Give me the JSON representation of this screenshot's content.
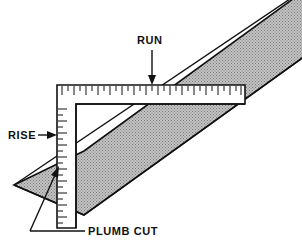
{
  "diagram": {
    "background_color": "#ffffff",
    "line_color": "#111111",
    "board_fill_color": "#b8b8b8",
    "board_hatch_color": "#6f6f6f",
    "labels": {
      "run": "RUN",
      "rise": "RISE",
      "plumb_cut": "PLUMB CUT"
    },
    "annotations": [
      {
        "name": "run",
        "text": "RUN",
        "text_x": 137,
        "text_y": 44,
        "arrow_direction": "down",
        "arrow_from_x": 152,
        "arrow_from_y": 50,
        "arrow_to_x": 152,
        "arrow_to_y": 84,
        "points_at": "horizontal-arm-top-edge"
      },
      {
        "name": "rise",
        "text": "RISE",
        "text_x": 8,
        "text_y": 139,
        "arrow_direction": "right",
        "arrow_from_x": 38,
        "arrow_from_y": 135,
        "arrow_to_x": 57,
        "arrow_to_y": 135,
        "points_at": "vertical-arm-left-edge"
      },
      {
        "name": "plumb-cut",
        "text": "PLUMB CUT",
        "text_x": 88,
        "text_y": 235,
        "arrow_direction": "up-right",
        "leader_h_x1": 85,
        "leader_h_x2": 30,
        "leader_h_y": 231,
        "arrow_from_x": 30,
        "arrow_from_y": 231,
        "arrow_to_x": 58,
        "arrow_to_y": 168,
        "points_at": "rafter-angled-end"
      }
    ],
    "square": {
      "name": "framing-square",
      "outer_left": 57,
      "outer_top": 85,
      "outer_right": 245,
      "outer_bottom": 228,
      "arm_thickness": 19,
      "tick_count_horizontal": 32,
      "tick_count_vertical": 22
    },
    "rafter": {
      "name": "rafter-board",
      "slope_label": "rising left to right",
      "plumb_cut_end": "lower-left",
      "exits_frame_at": "top-right"
    }
  }
}
